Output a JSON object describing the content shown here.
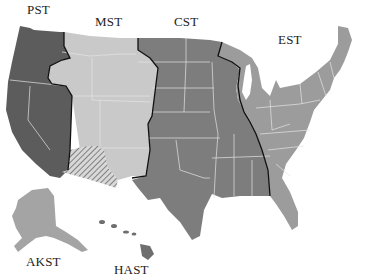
{
  "map": {
    "title": "US Time Zones",
    "zones": [
      {
        "id": "pst",
        "label": "PST",
        "color": "#5c5c5c"
      },
      {
        "id": "mst",
        "label": "MST",
        "color": "#c9c9c9"
      },
      {
        "id": "cst",
        "label": "CST",
        "color": "#7d7d7d"
      },
      {
        "id": "est",
        "label": "EST",
        "color": "#9c9c9c"
      },
      {
        "id": "akst",
        "label": "AKST",
        "color": "#a4a4a4"
      },
      {
        "id": "hast",
        "label": "HAST",
        "color": "#6e6e6e"
      }
    ],
    "arizona_pattern": "hatched"
  }
}
